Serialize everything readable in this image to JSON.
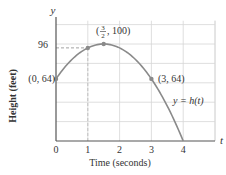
{
  "chart_data": {
    "type": "line",
    "title": "",
    "xlabel": "Time (seconds)",
    "ylabel": "Height (feet)",
    "x_axis_symbol": "t",
    "y_axis_symbol": "y",
    "xlim": [
      0,
      4.5
    ],
    "ylim": [
      0,
      115
    ],
    "x_ticks": [
      "0",
      "1",
      "2",
      "3",
      "4"
    ],
    "y_ticks": [
      "96"
    ],
    "grid": true,
    "series": [
      {
        "name": "y = h(t)",
        "function": "h(t) = -16t^2 + 48t + 64",
        "x": [
          0,
          0.5,
          1,
          1.5,
          2,
          2.5,
          3,
          3.5,
          4
        ],
        "values": [
          64,
          84,
          96,
          100,
          96,
          84,
          64,
          36,
          0
        ]
      }
    ],
    "annotations": [
      {
        "label": "(0, 64)",
        "x": 0,
        "y": 64
      },
      {
        "label_prefix": "(",
        "frac_num": "3",
        "frac_den": "2",
        "label_suffix": ", 100)",
        "x": 1.5,
        "y": 100
      },
      {
        "label": "(3, 64)",
        "x": 3,
        "y": 64
      },
      {
        "label": "y = h(t)",
        "x": 3.3,
        "y": 45
      }
    ],
    "guides": [
      {
        "type": "dashed-horizontal",
        "y": 96,
        "from_x": 0,
        "to_x": 1
      },
      {
        "type": "dashed-vertical",
        "x": 1,
        "from_y": 0,
        "to_y": 96
      }
    ],
    "colors": {
      "curve": "#8a8a8a",
      "axis": "#555555",
      "grid": "#d6d6d6",
      "point": "#8a8a8a"
    }
  }
}
